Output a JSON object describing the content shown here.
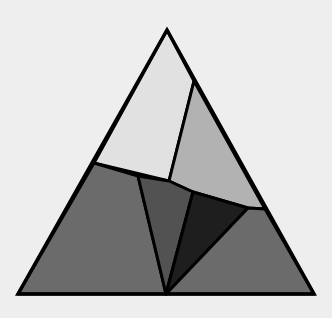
{
  "diagram": {
    "background": "#eeeeee",
    "stroke": "#000000",
    "stroke_width": 3,
    "outer_triangle": [
      [
        167,
        30
      ],
      [
        18,
        294
      ],
      [
        314,
        294
      ]
    ],
    "pieces": [
      {
        "name": "top-light-quad",
        "fill": "#e1e1e1",
        "points": [
          [
            167,
            30
          ],
          [
            194,
            81
          ],
          [
            169,
            181
          ],
          [
            94,
            163
          ]
        ]
      },
      {
        "name": "right-upper-quad",
        "fill": "#b2b2b2",
        "points": [
          [
            194,
            81
          ],
          [
            265,
            209
          ],
          [
            248,
            208
          ],
          [
            193,
            192
          ],
          [
            169,
            181
          ]
        ]
      },
      {
        "name": "left-lower-quad",
        "fill": "#6b6b6b",
        "points": [
          [
            94,
            163
          ],
          [
            138,
            176
          ],
          [
            166,
            294
          ],
          [
            18,
            294
          ]
        ]
      },
      {
        "name": "middle-dark-triangle",
        "fill": "#525252",
        "points": [
          [
            138,
            176
          ],
          [
            169,
            181
          ],
          [
            193,
            192
          ],
          [
            166,
            294
          ]
        ]
      },
      {
        "name": "black-triangle",
        "fill": "#1e1e1e",
        "points": [
          [
            193,
            192
          ],
          [
            248,
            208
          ],
          [
            166,
            294
          ]
        ]
      },
      {
        "name": "right-lower-quad",
        "fill": "#6b6b6b",
        "points": [
          [
            248,
            208
          ],
          [
            265,
            209
          ],
          [
            314,
            294
          ],
          [
            166,
            294
          ]
        ]
      }
    ]
  }
}
